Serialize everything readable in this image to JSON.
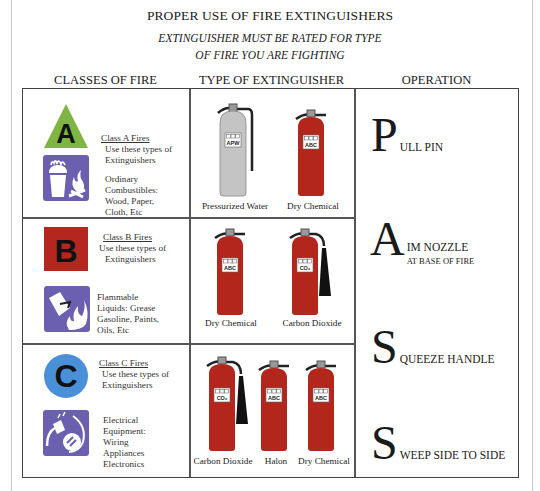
{
  "title": "PROPER USE OF FIRE EXTINGUISHERS",
  "subtitle_line1": "EXTINGUISHER MUST BE RATED FOR TYPE",
  "subtitle_line2": "OF FIRE YOU ARE FIGHTING",
  "columns": {
    "classes": "CLASSES  OF FIRE",
    "types": "TYPE OF EXTINGUISHER",
    "operation": "OPERATION"
  },
  "colors": {
    "class_a_green": "#7fb542",
    "class_b_red": "#b5261e",
    "class_c_blue": "#4a90d9",
    "pictogram_purple": "#6b5fb0",
    "extinguisher_red": "#b3261c",
    "extinguisher_gray": "#c4c4c4"
  },
  "rows": [
    {
      "class_letter": "A",
      "class_title": "Class A Fires",
      "use_text_1": "Use these types of",
      "use_text_2": "Extinguishers",
      "desc": [
        "Ordinary",
        "Combustibles:",
        "Wood, Paper,",
        "Cloth, Etc"
      ],
      "extinguishers": [
        {
          "label": "Pressurized Water",
          "rating": "APW",
          "color": "gray",
          "hose": false
        },
        {
          "label": "Dry Chemical",
          "rating": "ABC",
          "color": "red",
          "hose": false
        }
      ]
    },
    {
      "class_letter": "B",
      "class_title": "Class B Fires",
      "use_text_1": "Use these types of",
      "use_text_2": "Extinguishers",
      "desc": [
        "Flammable",
        "Liquids:  Grease",
        "Gasoline, Paints,",
        "Oils, Etc"
      ],
      "extinguishers": [
        {
          "label": "Dry Chemical",
          "rating": "ABC",
          "color": "red",
          "hose": false
        },
        {
          "label": "Carbon Dioxide",
          "rating": "CO₂",
          "color": "red",
          "hose": true
        }
      ]
    },
    {
      "class_letter": "C",
      "class_title": "Class C Fires",
      "use_text_1": "Use these types of",
      "use_text_2": "Extinguishers",
      "desc": [
        "Electrical",
        "Equipment:",
        "Wiring",
        "Appliances",
        "Electronics"
      ],
      "extinguishers": [
        {
          "label": "Carbon Dioxide",
          "rating": "CO₂",
          "color": "red",
          "hose": true
        },
        {
          "label": "Halon",
          "rating": "ABC",
          "color": "red",
          "hose": false
        },
        {
          "label": "Dry Chemical",
          "rating": "ABC",
          "color": "red",
          "hose": false
        }
      ]
    }
  ],
  "operation": [
    {
      "letter": "P",
      "rest": "ULL PIN",
      "sub": ""
    },
    {
      "letter": "A",
      "rest": "IM NOZZLE",
      "sub": "AT BASE OF FIRE"
    },
    {
      "letter": "S",
      "rest": "QUEEZE HANDLE",
      "sub": ""
    },
    {
      "letter": "S",
      "rest": "WEEP SIDE TO SIDE",
      "sub": ""
    }
  ]
}
